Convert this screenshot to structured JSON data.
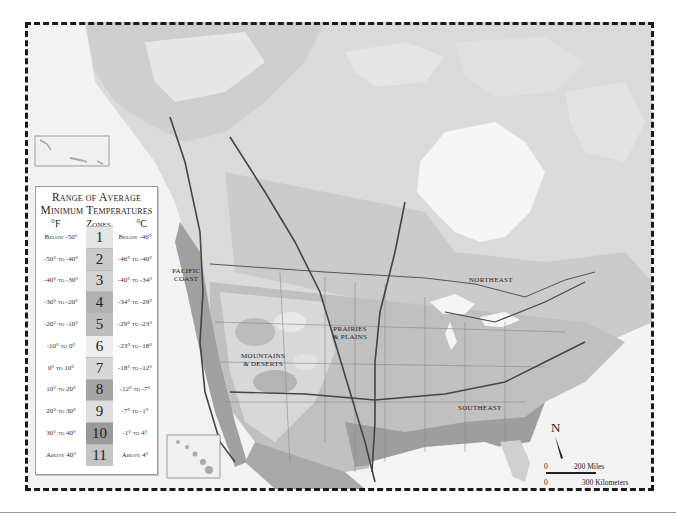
{
  "map": {
    "title": "USDA Plant Hardiness Zone Map of North America",
    "regions": [
      {
        "id": "pacific-coast",
        "label_line1": "PACIFIC",
        "label_line2": "COAST"
      },
      {
        "id": "mountains-deserts",
        "label_line1": "MOUNTAINS",
        "label_line2": "& DESERTS"
      },
      {
        "id": "prairies-plains",
        "label_line1": "PRAIRIES",
        "label_line2": "& PLAINS"
      },
      {
        "id": "northeast",
        "label_line1": "NORTHEAST",
        "label_line2": ""
      },
      {
        "id": "southeast",
        "label_line1": "SOUTHEAST",
        "label_line2": ""
      }
    ],
    "inset_labels": [
      "Aleutian Islands inset",
      "Hawaii inset"
    ],
    "north_arrow": "N",
    "scale": {
      "zero_miles": "0",
      "miles": "200 Miles",
      "zero_km": "0",
      "km": "300 Kilometers"
    }
  },
  "legend": {
    "title_line1": "Range of Average",
    "title_line2": "Minimum Temperatures",
    "col_f": "°F",
    "col_zones": "Zones",
    "col_c": "°C",
    "zones": [
      {
        "zone": "1",
        "f": "Below -50°",
        "c": "Below -46°",
        "color": "#e4e4e4"
      },
      {
        "zone": "2",
        "f": "-50° to -40°",
        "c": "-46° to -40°",
        "color": "#c9c9c9"
      },
      {
        "zone": "3",
        "f": "-40° to -30°",
        "c": "-40° to -34°",
        "color": "#d2d2d2"
      },
      {
        "zone": "4",
        "f": "-30° to -20°",
        "c": "-34° to -29°",
        "color": "#b1b1b1"
      },
      {
        "zone": "5",
        "f": "-20° to -10°",
        "c": "-29° to -23°",
        "color": "#bdbdbd"
      },
      {
        "zone": "6",
        "f": "-10° to 0°",
        "c": "-23° to -18°",
        "color": "#eeeeee"
      },
      {
        "zone": "7",
        "f": "0° to 10°",
        "c": "-18° to -12°",
        "color": "#d6d6d6"
      },
      {
        "zone": "8",
        "f": "10° to 20°",
        "c": "-12° to -7°",
        "color": "#a4a4a4"
      },
      {
        "zone": "9",
        "f": "20° to 30°",
        "c": "-7° to -1°",
        "color": "#dedede"
      },
      {
        "zone": "10",
        "f": "30° to 40°",
        "c": "-1° to 4°",
        "color": "#9a9a9a"
      },
      {
        "zone": "11",
        "f": "Above 40°",
        "c": "Above 4°",
        "color": "#c4c4c4"
      }
    ]
  },
  "colors": {
    "frame_bg": "#ececec",
    "land_light": "#dcdcdc",
    "land_mid": "#c4c4c4",
    "land_dark": "#a6a6a6",
    "water": "#f3f3f3",
    "border": "#1a1a1a"
  }
}
